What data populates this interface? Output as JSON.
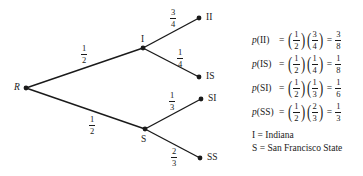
{
  "tree": {
    "root": {
      "label": "R",
      "x": 26,
      "y": 88
    },
    "nodes": [
      {
        "id": "I",
        "label": "I",
        "x": 143,
        "y": 48
      },
      {
        "id": "S",
        "label": "S",
        "x": 145,
        "y": 129
      }
    ],
    "leaves": [
      {
        "id": "II",
        "label": "II",
        "x": 199,
        "y": 18
      },
      {
        "id": "IS",
        "label": "IS",
        "x": 199,
        "y": 77
      },
      {
        "id": "SI",
        "label": "SI",
        "x": 201,
        "y": 99
      },
      {
        "id": "SS",
        "label": "SS",
        "x": 200,
        "y": 158
      }
    ],
    "branches": [
      {
        "from": "R",
        "to": "I",
        "num": "1",
        "den": "2"
      },
      {
        "from": "R",
        "to": "S",
        "num": "1",
        "den": "2"
      },
      {
        "from": "I",
        "to": "II",
        "num": "3",
        "den": "4"
      },
      {
        "from": "I",
        "to": "IS",
        "num": "1",
        "den": "4"
      },
      {
        "from": "S",
        "to": "SI",
        "num": "1",
        "den": "3"
      },
      {
        "from": "S",
        "to": "SS",
        "num": "2",
        "den": "3"
      }
    ]
  },
  "equations": [
    {
      "p": "p",
      "arg": "(II)",
      "eq": "=",
      "a_num": "1",
      "a_den": "2",
      "b_num": "3",
      "b_den": "4",
      "r_num": "3",
      "r_den": "8"
    },
    {
      "p": "p",
      "arg": "(IS)",
      "eq": "=",
      "a_num": "1",
      "a_den": "2",
      "b_num": "1",
      "b_den": "4",
      "r_num": "1",
      "r_den": "8"
    },
    {
      "p": "p",
      "arg": "(SI)",
      "eq": "=",
      "a_num": "1",
      "a_den": "2",
      "b_num": "1",
      "b_den": "3",
      "r_num": "1",
      "r_den": "6"
    },
    {
      "p": "p",
      "arg": "(SS)",
      "eq": "=",
      "a_num": "1",
      "a_den": "2",
      "b_num": "2",
      "b_den": "3",
      "r_num": "1",
      "r_den": "3"
    }
  ],
  "legend": [
    "I = Indiana",
    "S = San Francisco State"
  ]
}
